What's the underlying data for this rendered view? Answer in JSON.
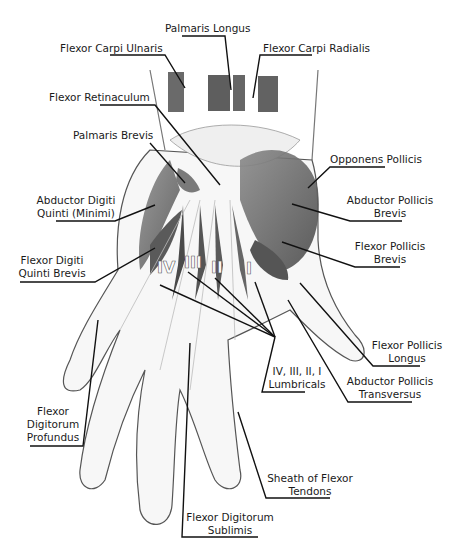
{
  "labels": {
    "palmaris_longus": "Palmaris Longus",
    "flexor_carpi_ulnaris": "Flexor Carpi Ulnaris",
    "flexor_carpi_radialis": "Flexor Carpi Radialis",
    "flexor_retinaculum": "Flexor Retinaculum",
    "palmaris_brevis": "Palmaris Brevis",
    "opponens_pollicis": "Opponens Pollicis",
    "abductor_digiti_quinti_1": "Abductor Digiti",
    "abductor_digiti_quinti_2": "Quinti (Minimi)",
    "abductor_pollicis_brevis_1": "Abductor Pollicis",
    "abductor_pollicis_brevis_2": "Brevis",
    "flexor_digiti_quinti_brevis_1": "Flexor Digiti",
    "flexor_digiti_quinti_brevis_2": "Quinti Brevis",
    "flexor_pollicis_brevis_1": "Flexor Pollicis",
    "flexor_pollicis_brevis_2": "Brevis",
    "flexor_pollicis_longus_1": "Flexor Pollicis",
    "flexor_pollicis_longus_2": "Longus",
    "lumbricals_1": "IV, III, II, I",
    "lumbricals_2": "Lumbricals",
    "abductor_pollicis_transversus_1": "Abductor Pollicis",
    "abductor_pollicis_transversus_2": "Transversus",
    "flexor_digitorum_profundus_1": "Flexor",
    "flexor_digitorum_profundus_2": "Digitorum",
    "flexor_digitorum_profundus_3": "Profundus",
    "sheath_flexor_tendons_1": "Sheath of Flexor",
    "sheath_flexor_tendons_2": "Tendons",
    "flexor_digitorum_sublimis_1": "Flexor Digitorum",
    "flexor_digitorum_sublimis_2": "Sublimis"
  },
  "lumbrical_numerals": [
    "IV",
    "III",
    "II",
    "I"
  ]
}
